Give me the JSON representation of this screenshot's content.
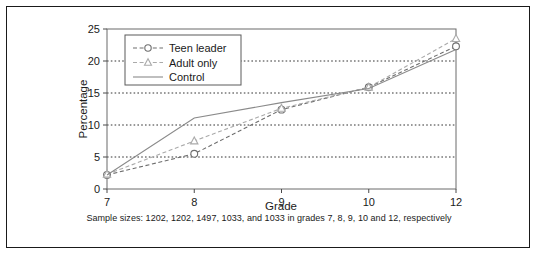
{
  "chart_data": {
    "type": "line",
    "title": "",
    "subtitle": "",
    "xlabel": "Grade",
    "ylabel": "Percentage",
    "categories": [
      "7",
      "8",
      "9",
      "10",
      "12"
    ],
    "x": [
      7,
      8,
      9,
      10,
      12
    ],
    "xtick_labels": [
      "7",
      "8",
      "9",
      "10",
      "12"
    ],
    "ytick_labels": [
      "0",
      "5",
      "10",
      "15",
      "20",
      "25"
    ],
    "yticks": [
      0,
      5,
      10,
      15,
      20,
      25
    ],
    "ylim": [
      0,
      25
    ],
    "grid": "horizontal-dotted",
    "legend_position": "top-left-inside",
    "series": [
      {
        "name": "Teen leader",
        "values": [
          2.2,
          5.5,
          12.4,
          15.9,
          22.3
        ],
        "marker": "circle",
        "line_style": "dashed",
        "color": "#6e6e6e"
      },
      {
        "name": "Adult only",
        "values": [
          2.3,
          7.5,
          12.6,
          15.9,
          23.5
        ],
        "marker": "triangle",
        "line_style": "dashed",
        "color": "#aaaaaa"
      },
      {
        "name": "Control",
        "values": [
          2.2,
          11.1,
          13.5,
          15.7,
          21.8
        ],
        "marker": "none",
        "line_style": "solid",
        "color": "#8a8a8a"
      }
    ]
  },
  "caption": {
    "text": "Sample sizes: 1202, 1202, 1497, 1033, and 1033 in grades 7, 8, 9, 10 and 12, respectively"
  },
  "legend": {
    "items": [
      {
        "label": "Teen leader"
      },
      {
        "label": "Adult only"
      },
      {
        "label": "Control"
      }
    ]
  },
  "colors": {
    "frame": "#1a1a1a",
    "axis": "#555555",
    "grid": "#333333",
    "text": "#1a1a1a",
    "teen_leader": "#6e6e6e",
    "adult_only": "#aaaaaa",
    "control": "#8a8a8a"
  }
}
